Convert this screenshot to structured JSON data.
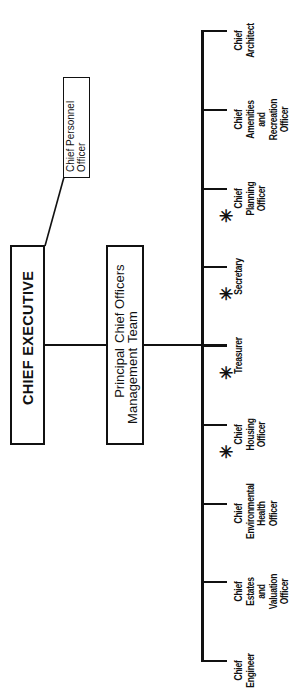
{
  "diagram": {
    "type": "organization-chart",
    "orientation": "rotated-90-ccw",
    "head": {
      "label": "CHIEF EXECUTIVE"
    },
    "staff_officer": {
      "lines": [
        "Chief Personnel",
        "Officer"
      ]
    },
    "team": {
      "left_lines": [
        "Principal",
        "Management"
      ],
      "right_lines": [
        "Chief Officers",
        "Team"
      ]
    },
    "departments": [
      {
        "lines": [
          "Chief",
          "Architect"
        ],
        "starred": false
      },
      {
        "lines": [
          "Chief",
          "Amenities",
          "and",
          "Recreation",
          "Officer"
        ],
        "starred": false
      },
      {
        "lines": [
          "Chief",
          "Planning",
          "Officer"
        ],
        "starred": true
      },
      {
        "lines": [
          "Secretary"
        ],
        "starred": true
      },
      {
        "lines": [
          "Treasurer"
        ],
        "starred": true
      },
      {
        "lines": [
          "Chief",
          "Housing",
          "Officer"
        ],
        "starred": true
      },
      {
        "lines": [
          "Chief",
          "Environmental",
          "Health",
          "Officer"
        ],
        "starred": false
      },
      {
        "lines": [
          "Chief",
          "Estates",
          "and",
          "Valuation",
          "Officer"
        ],
        "starred": false
      },
      {
        "lines": [
          "Chief",
          "Engineer"
        ],
        "starred": false
      }
    ],
    "star_symbol": "✳",
    "line_color": "#111111"
  }
}
